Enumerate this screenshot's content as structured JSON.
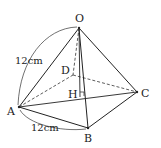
{
  "diagram": {
    "type": "square-pyramid",
    "vertices": {
      "O": {
        "label": "O",
        "x": 79,
        "y": 28
      },
      "A": {
        "label": "A",
        "x": 19,
        "y": 107
      },
      "B": {
        "label": "B",
        "x": 88,
        "y": 128
      },
      "C": {
        "label": "C",
        "x": 137,
        "y": 92
      },
      "D": {
        "label": "D",
        "x": 73,
        "y": 75
      },
      "H": {
        "label": "H",
        "x": 80,
        "y": 97
      }
    },
    "measurements": {
      "OA": "12cm",
      "AB": "12cm"
    },
    "colors": {
      "stroke": "#222222",
      "background": "#ffffff"
    }
  }
}
